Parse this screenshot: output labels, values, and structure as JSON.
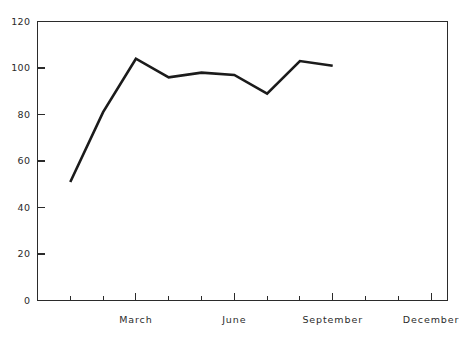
{
  "chart_data": {
    "type": "line",
    "title": "",
    "subtitle": "",
    "xlabel": "",
    "ylabel": "",
    "grid": false,
    "legend": false,
    "legend_position": "none",
    "x": [
      "January",
      "February",
      "March",
      "April",
      "May",
      "June",
      "July",
      "August",
      "September"
    ],
    "x_tick_labels": [
      "March",
      "June",
      "September",
      "December"
    ],
    "x_tick_positions": [
      3,
      6,
      9,
      12
    ],
    "x_minor_ticks": [
      1,
      2,
      4,
      5,
      7,
      8,
      10,
      11
    ],
    "xlim": [
      0,
      12.5
    ],
    "series": [
      {
        "name": "series-1",
        "color": "#1b1b1b",
        "values": [
          51,
          81,
          104,
          96,
          98,
          97,
          89,
          103,
          101
        ]
      }
    ],
    "values": [
      51,
      81,
      104,
      96,
      98,
      97,
      89,
      103,
      101
    ],
    "y_tick_labels": [
      "0",
      "20",
      "40",
      "60",
      "80",
      "100",
      "120"
    ],
    "y_ticks": [
      0,
      20,
      40,
      60,
      80,
      100,
      120
    ],
    "ylim": [
      0,
      120
    ],
    "axis_color": "#2b2b2b",
    "line_color": "#1b1b1b",
    "background_color": "#ffffff"
  }
}
